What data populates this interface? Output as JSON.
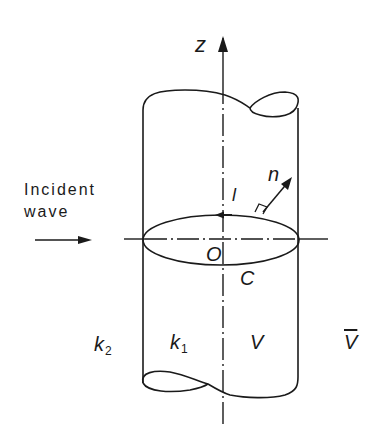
{
  "diagram": {
    "labels": {
      "z_axis": "z",
      "incident_wave_line1": "Incident",
      "incident_wave_line2": "wave",
      "tangent": "l",
      "normal": "n",
      "origin": "O",
      "contour": "C",
      "outer_medium": "k",
      "outer_medium_sub": "2",
      "inner_medium": "k",
      "inner_medium_sub": "1",
      "inner_region": "V",
      "outer_region": "V"
    },
    "colors": {
      "stroke": "#1a1a1a",
      "background": "#ffffff"
    }
  }
}
